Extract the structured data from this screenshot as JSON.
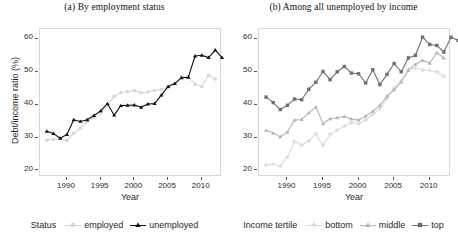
{
  "figure": {
    "width": 458,
    "height": 238,
    "background": "#ffffff"
  },
  "panels": [
    {
      "id": "a",
      "title": "(a) By employment status",
      "legend_title": "Status"
    },
    {
      "id": "b",
      "title": "(b) Among all unemployed by income",
      "legend_title": "Income tertile"
    }
  ],
  "chart_data": [
    {
      "type": "line",
      "title": "(a) By employment status",
      "xlabel": "Year",
      "ylabel": "Debt/income ratio (%)",
      "xlim": [
        1986,
        2013
      ],
      "ylim": [
        18,
        63
      ],
      "xticks": [
        1990,
        1995,
        2000,
        2005,
        2010
      ],
      "yticks": [
        20,
        30,
        40,
        50,
        60
      ],
      "grid": false,
      "legend_title": "Status",
      "legend_position": "bottom",
      "x": [
        1987,
        1988,
        1989,
        1990,
        1991,
        1992,
        1993,
        1994,
        1995,
        1996,
        1997,
        1998,
        1999,
        2000,
        2001,
        2002,
        2003,
        2004,
        2005,
        2006,
        2007,
        2008,
        2009,
        2010,
        2011,
        2012
      ],
      "series": [
        {
          "name": "employed",
          "color": "#d6d6d6",
          "marker": "circle",
          "values": [
            29.2,
            29.5,
            29.6,
            29.1,
            31.3,
            32.9,
            34.8,
            36.1,
            37.5,
            39.8,
            42.5,
            43.6,
            43.9,
            44.3,
            43.6,
            43.9,
            44.3,
            44.6,
            45.2,
            46.4,
            48.6,
            48.5,
            46.2,
            45.5,
            48.9,
            47.8
          ]
        },
        {
          "name": "unemployed",
          "color": "#111111",
          "marker": "triangle",
          "values": [
            31.9,
            31.2,
            29.8,
            30.9,
            35.4,
            34.9,
            35.4,
            36.7,
            38.1,
            40.3,
            36.8,
            39.7,
            39.8,
            39.9,
            39.2,
            40.2,
            40.3,
            42.9,
            45.5,
            46.4,
            48.2,
            48.3,
            54.8,
            55.0,
            54.3,
            56.6,
            54.3
          ]
        }
      ]
    },
    {
      "type": "line",
      "title": "(b) Among all unemployed by income",
      "xlabel": "Year",
      "ylabel": "",
      "xlim": [
        1986,
        2013
      ],
      "ylim": [
        18,
        63
      ],
      "xticks": [
        1990,
        1995,
        2000,
        2005,
        2010
      ],
      "yticks": [
        20,
        30,
        40,
        50,
        60
      ],
      "grid": false,
      "legend_title": "Income tertile",
      "legend_position": "bottom",
      "x": [
        1987,
        1988,
        1989,
        1990,
        1991,
        1992,
        1993,
        1994,
        1995,
        1996,
        1997,
        1998,
        1999,
        2000,
        2001,
        2002,
        2003,
        2004,
        2005,
        2006,
        2007,
        2008,
        2009,
        2010,
        2011,
        2012
      ],
      "series": [
        {
          "name": "bottom",
          "color": "#dcdcdc",
          "marker": "plus",
          "values": [
            21.6,
            21.9,
            21.3,
            24.1,
            28.8,
            27.7,
            29.0,
            31.1,
            27.6,
            31.0,
            32.2,
            33.4,
            34.5,
            34.2,
            35.4,
            37.0,
            38.7,
            41.9,
            45.0,
            47.3,
            50.8,
            51.1,
            50.6,
            50.4,
            50.0,
            48.5
          ]
        },
        {
          "name": "middle",
          "color": "#b5b5b5",
          "marker": "triangle",
          "values": [
            32.2,
            31.4,
            30.2,
            31.7,
            35.3,
            35.5,
            37.5,
            39.3,
            34.2,
            35.7,
            36.0,
            36.4,
            35.6,
            35.3,
            36.5,
            38.0,
            39.8,
            42.6,
            44.5,
            46.9,
            50.4,
            52.3,
            53.5,
            52.6,
            55.8,
            54.2
          ]
        },
        {
          "name": "top",
          "color": "#6f6f6f",
          "marker": "square",
          "values": [
            42.3,
            40.6,
            38.5,
            39.8,
            41.7,
            41.5,
            44.7,
            46.8,
            50.1,
            47.6,
            50.0,
            51.6,
            49.6,
            49.4,
            46.6,
            50.6,
            46.1,
            49.2,
            52.5,
            50.0,
            54.2,
            55.0,
            60.5,
            58.3,
            58.0,
            56.0,
            60.5,
            59.5
          ]
        }
      ]
    }
  ],
  "axes": {
    "xlabel": "Year",
    "ylabel": "Debt/income ratio (%)",
    "xticks": [
      "1990",
      "1995",
      "2000",
      "2005",
      "2010"
    ],
    "yticks": [
      "20",
      "30",
      "40",
      "50",
      "60"
    ]
  },
  "colors": {
    "employed": "#d6d6d6",
    "unemployed": "#111111",
    "bottom": "#dcdcdc",
    "middle": "#b5b5b5",
    "top": "#6f6f6f",
    "frame": "#d8d8d8",
    "text": "#1f1f1f"
  }
}
